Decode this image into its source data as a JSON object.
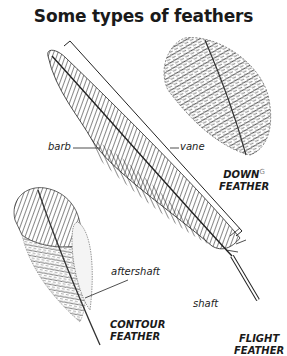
{
  "title": "Some types of feathers",
  "labels": {
    "barb": "barb",
    "vane": "vane",
    "aftershaft": "aftershaft",
    "shaft": "shaft"
  },
  "captions": {
    "down_line1": "DOWN",
    "down_sup": "G",
    "down_line2": "FEATHER",
    "contour_line1": "CONTOUR",
    "contour_line2": "FEATHER",
    "flight_line1": "FLIGHT",
    "flight_line2": "FEATHER"
  },
  "colors": {
    "ink": "#1a1a1a",
    "background": "#ffffff"
  }
}
